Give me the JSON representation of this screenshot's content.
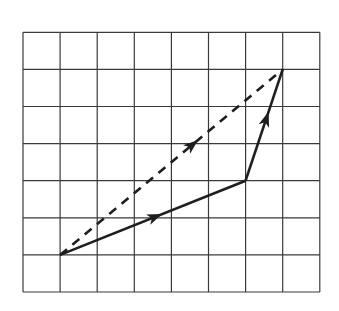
{
  "diagram": {
    "type": "vector-addition-grid",
    "grid": {
      "columns": 8,
      "rows": 7,
      "origin_px": [
        23,
        292
      ],
      "cell_px": 37.1,
      "line_color": "#3a3a3a"
    },
    "vectors": [
      {
        "name": "vector-a",
        "style": "solid",
        "from": [
          1,
          1
        ],
        "to": [
          6,
          3
        ],
        "components": [
          5,
          2
        ],
        "arrow_at": 0.55
      },
      {
        "name": "vector-b",
        "style": "solid",
        "from": [
          6,
          3
        ],
        "to": [
          7,
          6
        ],
        "components": [
          1,
          3
        ],
        "arrow_at": 0.62
      },
      {
        "name": "resultant",
        "style": "dashed",
        "from": [
          1,
          1
        ],
        "to": [
          7,
          6
        ],
        "components": [
          6,
          5
        ],
        "arrow_at": 0.62
      }
    ],
    "stroke_color": "#1e1e1e"
  }
}
